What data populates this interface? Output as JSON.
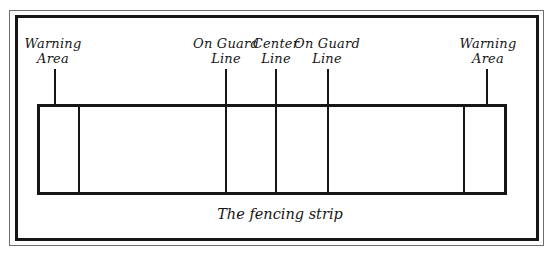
{
  "diagram": {
    "caption": "The fencing strip",
    "labels": [
      {
        "id": "warning-area-left",
        "line1": "Warning",
        "line2": "Area"
      },
      {
        "id": "on-guard-line-left",
        "line1": "On Guard",
        "line2": "Line"
      },
      {
        "id": "center-line",
        "line1": "Center",
        "line2": "Line"
      },
      {
        "id": "on-guard-line-right",
        "line1": "On Guard",
        "line2": "Line"
      },
      {
        "id": "warning-area-right",
        "line1": "Warning",
        "line2": "Area"
      }
    ],
    "colors": {
      "ink": "#161616",
      "frame_outer": "#6e6e6e",
      "background": "#ffffff"
    }
  }
}
